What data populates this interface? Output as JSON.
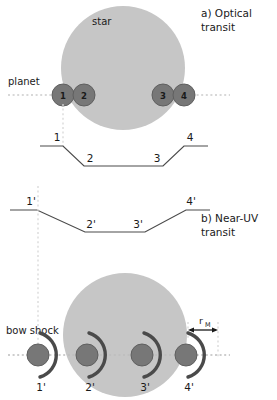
{
  "figure": {
    "width": 277,
    "height": 400,
    "background": "#ffffff"
  },
  "colors": {
    "star_fill": "#c6c6c6",
    "star_stroke": "#c6c6c6",
    "planet_fill": "#777777",
    "planet_stroke": "#5f5f5f",
    "curve_stroke": "#4a4a4a",
    "bowshock_stroke": "#4a4a4a",
    "guide_dotted": "#cfcfcf",
    "text": "#1a1a1a"
  },
  "panel_a": {
    "caption_line1": "a) Optical",
    "caption_line2": "transit",
    "star_label": "star",
    "planet_label": "planet",
    "star": {
      "cx": 123,
      "cy": 68,
      "r": 62
    },
    "orbit_y": 95,
    "planets": [
      {
        "label": "1",
        "cx": 63,
        "cy": 95,
        "r": 11
      },
      {
        "label": "2",
        "cx": 84,
        "cy": 95,
        "r": 11
      },
      {
        "label": "3",
        "cx": 163,
        "cy": 95,
        "r": 11
      },
      {
        "label": "4",
        "cx": 184,
        "cy": 95,
        "r": 11
      }
    ],
    "lightcurve": {
      "points": [
        [
          40,
          146
        ],
        [
          63,
          146
        ],
        [
          84,
          166
        ],
        [
          163,
          166
        ],
        [
          184,
          146
        ],
        [
          208,
          146
        ]
      ],
      "labels": [
        {
          "text": "1",
          "x": 60,
          "y": 141
        },
        {
          "text": "2",
          "x": 88,
          "y": 161
        },
        {
          "text": "3",
          "x": 158,
          "y": 161
        },
        {
          "text": "4",
          "x": 181,
          "y": 141
        }
      ]
    }
  },
  "panel_b": {
    "caption_line1": "b) Near-UV",
    "caption_line2": "transit",
    "bow_shock_label": "bow shock",
    "rm_label": "r",
    "rm_subscript": "M",
    "star": {
      "cx": 125,
      "cy": 335,
      "r": 62
    },
    "orbit_y": 355,
    "planets": [
      {
        "label": "1'",
        "cx": 38,
        "cy": 355,
        "r": 11
      },
      {
        "label": "2'",
        "cx": 87,
        "cy": 355,
        "r": 11
      },
      {
        "label": "3'",
        "cx": 142,
        "cy": 355,
        "r": 11
      },
      {
        "label": "4'",
        "cx": 186,
        "cy": 355,
        "r": 11
      }
    ],
    "lightcurve": {
      "points": [
        [
          10,
          210
        ],
        [
          37,
          210
        ],
        [
          85,
          232
        ],
        [
          145,
          232
        ],
        [
          186,
          210
        ],
        [
          210,
          210
        ]
      ],
      "labels": [
        {
          "text": "1'",
          "x": 33,
          "y": 205
        },
        {
          "text": "2'",
          "x": 88,
          "y": 227
        },
        {
          "text": "3'",
          "x": 137,
          "y": 227
        },
        {
          "text": "4'",
          "x": 181,
          "y": 205
        }
      ]
    },
    "rm_measure": {
      "x1": 188,
      "x2": 218,
      "y": 330
    }
  }
}
